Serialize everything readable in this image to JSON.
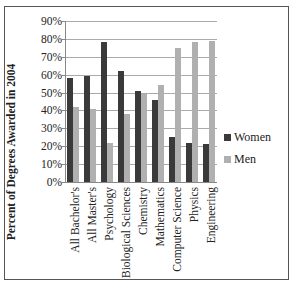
{
  "chart_data": {
    "type": "bar",
    "title": "",
    "xlabel": "",
    "ylabel": "Percent of Degrees Awarded in 2004",
    "ylim": [
      0,
      90
    ],
    "yticks": [
      "0%",
      "10%",
      "20%",
      "30%",
      "40%",
      "50%",
      "60%",
      "70%",
      "80%",
      "90%"
    ],
    "grid": true,
    "legend_position": "right",
    "categories": [
      "All Bachelor's",
      "All Master's",
      "Psychology",
      "Biological Sciences",
      "Chemistry",
      "Mathematics",
      "Computer Science",
      "Physics",
      "Engineering"
    ],
    "series": [
      {
        "name": "Women",
        "color": "#3a3a3a",
        "values": [
          58,
          59,
          78,
          62,
          51,
          46,
          25,
          22,
          21
        ]
      },
      {
        "name": "Men",
        "color": "#b0b0b0",
        "values": [
          42,
          41,
          22,
          38,
          49,
          54,
          75,
          78,
          79
        ]
      }
    ]
  }
}
